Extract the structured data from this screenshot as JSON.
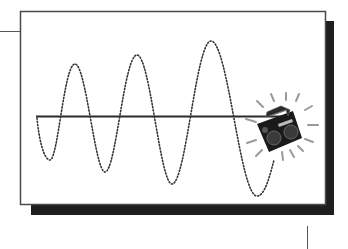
{
  "diagram": {
    "title": "",
    "colors": {
      "background": "#ffffff",
      "frame": "#4a4a4a",
      "shadow": "#1e1e1e",
      "wave": "#333333",
      "axis": "#2a2a2a",
      "boombox": "#1a1a1a"
    },
    "elements": {
      "wave": {
        "style": "dotted",
        "peaks": [
          [
            75,
            64
          ],
          [
            137,
            55
          ],
          [
            211,
            41
          ]
        ],
        "troughs": [
          [
            50,
            160
          ],
          [
            105,
            172
          ],
          [
            172,
            184
          ],
          [
            257,
            196
          ]
        ]
      },
      "axis": {
        "y": 116,
        "x_start": 36,
        "x_end": 290
      },
      "icon": "boombox-icon"
    }
  }
}
